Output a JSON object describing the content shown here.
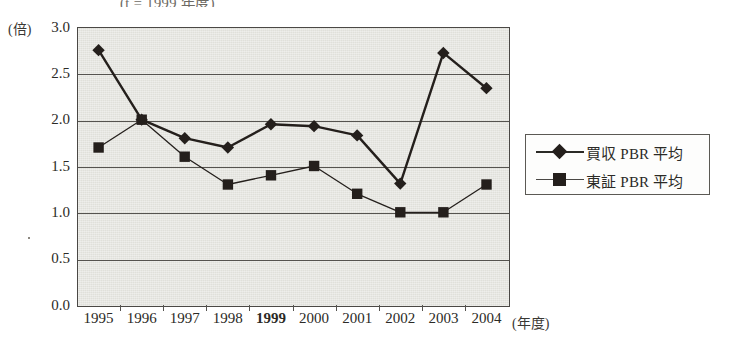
{
  "title_clipped": "(t = 1999 年度)",
  "axes": {
    "y_unit": "(倍)",
    "x_unit": "(年度)",
    "y_ticks": [
      "3.0",
      "2.5",
      "2.0",
      "1.5",
      "1.0",
      "0.5",
      "0.0"
    ]
  },
  "legend": {
    "items": [
      {
        "label": "買収 PBR 平均",
        "marker": "diamond",
        "color": "#241f1c"
      },
      {
        "label": "東証 PBR 平均",
        "marker": "square",
        "color": "#241f1c"
      }
    ]
  },
  "chart_data": {
    "type": "line",
    "title": "(t = 1999 年度)",
    "xlabel": "(年度)",
    "ylabel": "(倍)",
    "ylim": [
      0.0,
      3.0
    ],
    "ytick_step": 0.5,
    "grid": true,
    "legend_position": "right",
    "highlight_category": "1999",
    "categories": [
      "1995",
      "1996",
      "1997",
      "1998",
      "1999",
      "2000",
      "2001",
      "2002",
      "2003",
      "2004"
    ],
    "series": [
      {
        "name": "買収 PBR 平均",
        "marker": "diamond",
        "color": "#241f1c",
        "line_width": 2.4,
        "values": [
          2.75,
          2.0,
          1.8,
          1.7,
          1.95,
          1.93,
          1.83,
          1.31,
          2.72,
          2.34
        ]
      },
      {
        "name": "東証 PBR 平均",
        "marker": "square",
        "color": "#241f1c",
        "line_width": 1.3,
        "values": [
          1.7,
          2.0,
          1.6,
          1.3,
          1.4,
          1.5,
          1.2,
          1.0,
          1.0,
          1.3
        ]
      }
    ]
  }
}
